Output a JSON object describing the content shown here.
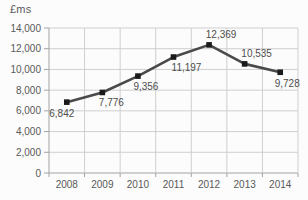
{
  "chart": {
    "title": "£ms"
  },
  "chart_data": {
    "type": "line",
    "title": "£ms",
    "categories": [
      "2008",
      "2009",
      "2010",
      "2011",
      "2012",
      "2013",
      "2014"
    ],
    "values": [
      6842,
      7776,
      9356,
      11197,
      12369,
      10535,
      9728
    ],
    "data_labels": [
      "6,842",
      "7,776",
      "9,356",
      "11,197",
      "12,369",
      "10,535",
      "9,728"
    ],
    "ytick_labels": [
      "0",
      "2,000",
      "4,000",
      "6,000",
      "8,000",
      "10,000",
      "12,000",
      "14,000"
    ],
    "xlabel": "",
    "ylabel": "£ms",
    "ylim": [
      0,
      14000
    ],
    "ytick_step": 2000,
    "grid": true,
    "legend": "none",
    "line_color": "#4a4a4a",
    "marker": "square",
    "marker_color": "#1a1a1a",
    "grid_color": "#cfcfcf",
    "axis_color": "#a3a3a3",
    "text_color": "#595959",
    "label_positions": [
      "below",
      "below",
      "below",
      "below",
      "above",
      "above",
      "below"
    ],
    "label_offsets": [
      [
        -5,
        15
      ],
      [
        9,
        14
      ],
      [
        8,
        14
      ],
      [
        13,
        14
      ],
      [
        12,
        -7
      ],
      [
        12,
        -7
      ],
      [
        7,
        15
      ]
    ]
  }
}
